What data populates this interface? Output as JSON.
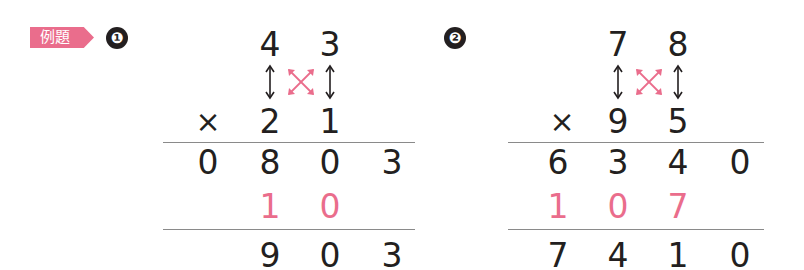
{
  "header": {
    "badge_label": "例題"
  },
  "problems": [
    {
      "number": "❶",
      "multiplicand": [
        "4",
        "3"
      ],
      "operator": "×",
      "multiplier": [
        "2",
        "1"
      ],
      "partial_row": [
        "0",
        "8",
        "0",
        "3"
      ],
      "carry_row": [
        "1",
        "0"
      ],
      "result": [
        "9",
        "0",
        "3"
      ]
    },
    {
      "number": "❷",
      "multiplicand": [
        "7",
        "8"
      ],
      "operator": "×",
      "multiplier": [
        "9",
        "5"
      ],
      "partial_row": [
        "6",
        "3",
        "4",
        "0"
      ],
      "carry_row": [
        "1",
        "0",
        "7"
      ],
      "result": [
        "7",
        "4",
        "1",
        "0"
      ]
    }
  ],
  "colors": {
    "accent": "#ea6d8c",
    "text": "#231f20",
    "rule": "#8a8a8a"
  }
}
